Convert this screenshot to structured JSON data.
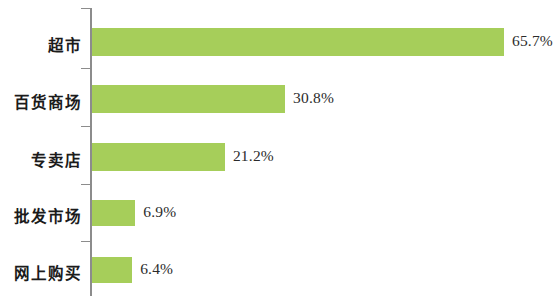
{
  "chart_data": {
    "type": "bar",
    "orientation": "horizontal",
    "title": "",
    "subtitle": "",
    "xlabel": "",
    "ylabel": "",
    "categories": [
      "超市",
      "百货商场",
      "专卖店",
      "批发市场",
      "网上购买"
    ],
    "values": [
      65.7,
      30.8,
      21.2,
      6.9,
      6.4
    ],
    "value_labels": [
      "65.7%",
      "30.8%",
      "21.2%",
      "6.9%",
      "6.4%"
    ],
    "unit": "%",
    "xlim": [
      0,
      65.7
    ],
    "grid": false,
    "legend": null,
    "legend_position": "none",
    "axis_ticks_visible": true,
    "x_axis_visible": false,
    "y_axis_visible": true,
    "bar_color": "#a6ce5a",
    "axis_color": "#8c8c8c",
    "label_color": "#1b1b1b",
    "value_color": "#2b2b2b",
    "background": "#ffffff",
    "series": [
      {
        "name": "",
        "values": [
          65.7,
          30.8,
          21.2,
          6.9,
          6.4
        ]
      }
    ],
    "points": [
      {
        "category": "超市",
        "value": 65.7,
        "label": "65.7%"
      },
      {
        "category": "百货商场",
        "value": 30.8,
        "label": "30.8%"
      },
      {
        "category": "专卖店",
        "value": 21.2,
        "label": "21.2%"
      },
      {
        "category": "批发市场",
        "value": 6.9,
        "label": "6.9%"
      },
      {
        "category": "网上购买",
        "value": 6.4,
        "label": "6.4%"
      }
    ]
  },
  "layout": {
    "axis_x_px": 90,
    "bar_start_px": 92,
    "px_per_percent": 6.27,
    "rows": [
      {
        "bar_top": 28,
        "bar_height": 28,
        "label_top": 33,
        "tick_top": 8
      },
      {
        "bar_top": 85,
        "bar_height": 28,
        "label_top": 90,
        "tick_top": 68
      },
      {
        "bar_top": 143,
        "bar_height": 28,
        "label_top": 148,
        "tick_top": 126
      },
      {
        "bar_top": 200,
        "bar_height": 26,
        "label_top": 204,
        "tick_top": 184
      },
      {
        "bar_top": 257,
        "bar_height": 26,
        "label_top": 261,
        "tick_top": 241
      }
    ]
  }
}
